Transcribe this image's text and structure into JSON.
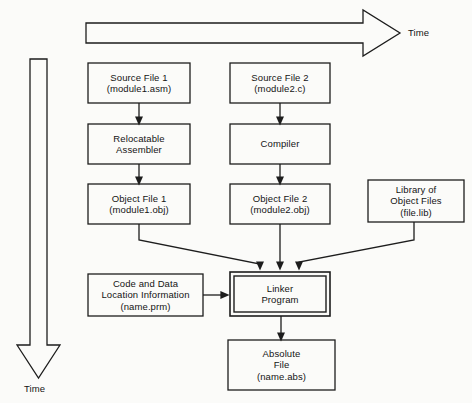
{
  "diagram": {
    "background_color": "#fbfbf9",
    "line_color": "#1d1d1d",
    "text_color": "#141414",
    "axes": {
      "horizontal_time_label": "Time",
      "vertical_time_label": "Time"
    },
    "nodes": {
      "source_file_1": {
        "line1": "Source File 1",
        "line2": "(module1.asm)"
      },
      "source_file_2": {
        "line1": "Source File 2",
        "line2": "(module2.c)"
      },
      "relocatable_assembler": {
        "line1": "Relocatable",
        "line2": "Assembler"
      },
      "compiler": {
        "line1": "Compiler"
      },
      "object_file_1": {
        "line1": "Object File 1",
        "line2": "(module1.obj)"
      },
      "object_file_2": {
        "line1": "Object File 2",
        "line2": "(module2.obj)"
      },
      "library_of_object_files": {
        "line1": "Library of",
        "line2": "Object Files",
        "line3": "(file.lib)"
      },
      "code_and_data_location": {
        "line1": "Code and Data",
        "line2": "Location Information",
        "line3": "(name.prm)"
      },
      "linker_program": {
        "line1": "Linker",
        "line2": "Program"
      },
      "absolute_file": {
        "line1": "Absolute",
        "line2": "File",
        "line3": "(name.abs)"
      }
    }
  }
}
